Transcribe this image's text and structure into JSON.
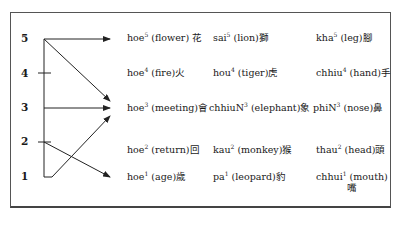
{
  "tones": [
    {
      "label": "5",
      "y": 38
    },
    {
      "label": "4",
      "y": 73
    },
    {
      "label": "3",
      "y": 107
    },
    {
      "label": "2",
      "y": 141
    },
    {
      "label": "1",
      "y": 176
    }
  ],
  "rows": [
    {
      "tone": "5",
      "cells": [
        {
          "syllable": "hoe",
          "tone": "5",
          "gloss": "(flower)",
          "hanzi": "花"
        },
        {
          "syllable": "sai",
          "tone": "5",
          "gloss": "(lion)",
          "hanzi": "獅"
        },
        {
          "syllable": "kha",
          "tone": "5",
          "gloss": "(leg)",
          "hanzi": "腳"
        }
      ]
    },
    {
      "tone": "4",
      "cells": [
        {
          "syllable": "hoe",
          "tone": "4",
          "gloss": "(fire)",
          "hanzi": "火"
        },
        {
          "syllable": "hou",
          "tone": "4",
          "gloss": "(tiger)",
          "hanzi": "虎"
        },
        {
          "syllable": "chhiu",
          "tone": "4",
          "gloss": "(hand)",
          "hanzi": "手"
        }
      ]
    },
    {
      "tone": "3",
      "cells": [
        {
          "syllable": "hoe",
          "tone": "3",
          "gloss": "(meeting)",
          "hanzi": "會"
        },
        {
          "syllable": "chhiuN",
          "tone": "3",
          "gloss": "(elephant)",
          "hanzi": "象"
        },
        {
          "syllable": "phiN",
          "tone": "3",
          "gloss": "(nose)",
          "hanzi": "鼻"
        }
      ]
    },
    {
      "tone": "2",
      "cells": [
        {
          "syllable": "hoe",
          "tone": "2",
          "gloss": "(return)",
          "hanzi": "回"
        },
        {
          "syllable": "kau",
          "tone": "2",
          "gloss": "(monkey)",
          "hanzi": "猴"
        },
        {
          "syllable": "thau",
          "tone": "2",
          "gloss": "(head)",
          "hanzi": "頭"
        }
      ]
    },
    {
      "tone": "1",
      "cells": [
        {
          "syllable": "hoe",
          "tone": "1",
          "gloss": "(age)",
          "hanzi": "歲"
        },
        {
          "syllable": "pa",
          "tone": "1",
          "gloss": "(leopard)",
          "hanzi": "豹"
        },
        {
          "syllable": "chhui",
          "tone": "1",
          "gloss": "(mouth)",
          "hanzi": "嘴"
        }
      ]
    }
  ],
  "arrows": [
    {
      "from": "5",
      "to": "5"
    },
    {
      "from": "5",
      "to": "3"
    },
    {
      "from": "3",
      "to": "3"
    },
    {
      "from": "2",
      "to": "1"
    },
    {
      "from": "1",
      "to": "3"
    }
  ],
  "colors": {
    "line": "#222222",
    "frame": "#555555",
    "text": "#1a1a1a"
  }
}
